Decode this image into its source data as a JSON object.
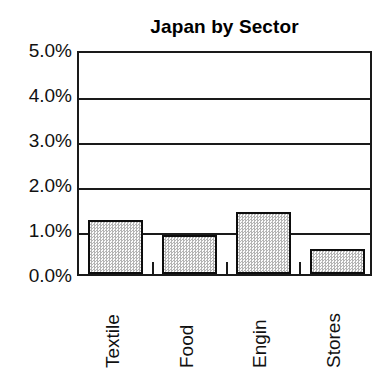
{
  "chart_data": {
    "type": "bar",
    "title": "Japan by Sector",
    "xlabel": "",
    "ylabel": "",
    "categories": [
      "Textile",
      "Food",
      "Engin",
      "Stores"
    ],
    "values": [
      1.2,
      0.87,
      1.38,
      0.56
    ],
    "value_labels": [
      "1.2%",
      "0.87%",
      "1.38%",
      "0.56%"
    ],
    "ylim": [
      0.0,
      5.0
    ],
    "yticks": [
      0.0,
      1.0,
      2.0,
      3.0,
      4.0,
      5.0
    ],
    "ytick_labels": [
      "0.0%",
      "1.0%",
      "2.0%",
      "3.0%",
      "4.0%",
      "5.0%"
    ],
    "grid": true,
    "grid_axis": "y",
    "legend": false,
    "legend_position": "none",
    "orientation": "vertical",
    "xtick_label_rotation": 90,
    "units": "percent",
    "series": [
      {
        "name": "Japan by Sector",
        "values": [
          1.2,
          0.87,
          1.38,
          0.56
        ]
      }
    ]
  },
  "style": {
    "bar_fill": "#e8e8e8",
    "bar_edge": "#0d0d0d",
    "axis_color": "#1a1a1a",
    "text_color": "#111111",
    "background": "#ffffff"
  }
}
